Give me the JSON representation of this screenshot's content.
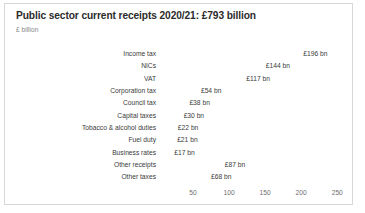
{
  "chart_data": {
    "type": "bar",
    "orientation": "horizontal",
    "title": "Public sector current receipts 2020/21: £793 billion",
    "subtitle": "£ billion",
    "xlabel": "",
    "ylabel": "",
    "xlim": [
      0,
      270
    ],
    "grid": false,
    "legend": null,
    "tick_labels": [
      "50",
      "100",
      "150",
      "200",
      "250"
    ],
    "ticks": [
      50,
      100,
      150,
      200,
      250
    ],
    "categories": [
      "Income tax",
      "NICs",
      "VAT",
      "Corporation tax",
      "Council tax",
      "Capital taxes",
      "Tobacco & alcohol duties",
      "Fuel duty",
      "Business rates",
      "Other receipts",
      "Other taxes"
    ],
    "values": [
      196,
      144,
      117,
      54,
      38,
      30,
      22,
      21,
      17,
      87,
      68
    ],
    "data_labels": [
      "£196 bn",
      "£144 bn",
      "£117 bn",
      "£54 bn",
      "£38 bn",
      "£30 bn",
      "£22 bn",
      "£21 bn",
      "£17 bn",
      "£87 bn",
      "£68 bn"
    ],
    "bar_color": "#4a4a4a",
    "title_color": "#2b2b2b",
    "subtitle_color": "#8a8a8a",
    "axis_text_color": "#6e6e6e",
    "border_color": "#d8d8d8",
    "background": "#ffffff"
  }
}
